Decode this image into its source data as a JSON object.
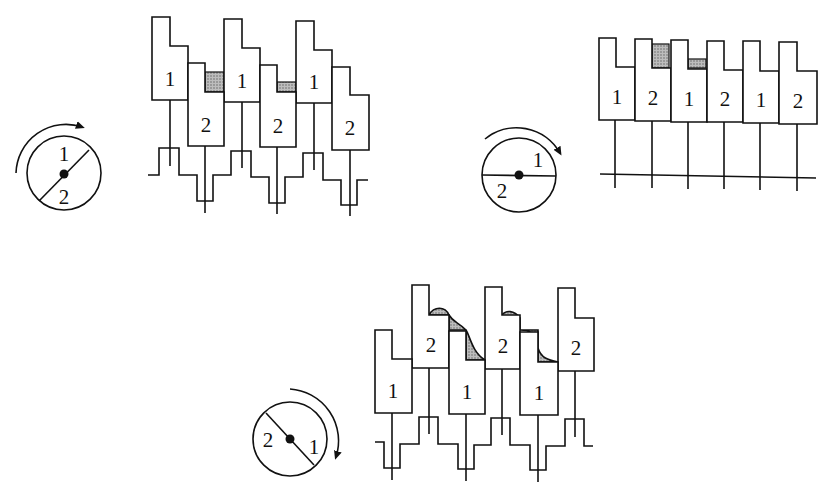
{
  "figure": {
    "panels": [
      {
        "id": "a",
        "description": "Reciprocating pistons with crank at intermediate angle; gas volumes shaded between adjacent pistons",
        "rotation": "clockwise",
        "crank_labels": [
          "1",
          "2"
        ],
        "piston_labels": [
          "1",
          "2",
          "1",
          "2",
          "1",
          "2"
        ]
      },
      {
        "id": "b",
        "description": "Crank horizontal; pistons aligned in a row",
        "rotation": "clockwise",
        "crank_labels": [
          "1",
          "2"
        ],
        "piston_labels": [
          "1",
          "2",
          "1",
          "2",
          "1",
          "2"
        ]
      },
      {
        "id": "c",
        "description": "Crank at opposite angle; pistons 2 raised, shaded wave profile of displaced fluid",
        "rotation": "clockwise",
        "crank_labels": [
          "2",
          "1"
        ],
        "piston_labels": [
          "1",
          "2",
          "1",
          "2",
          "1",
          "2"
        ]
      }
    ],
    "colors": {
      "line": "#111111",
      "shade": "#9a9a9a",
      "background": "#ffffff"
    }
  }
}
